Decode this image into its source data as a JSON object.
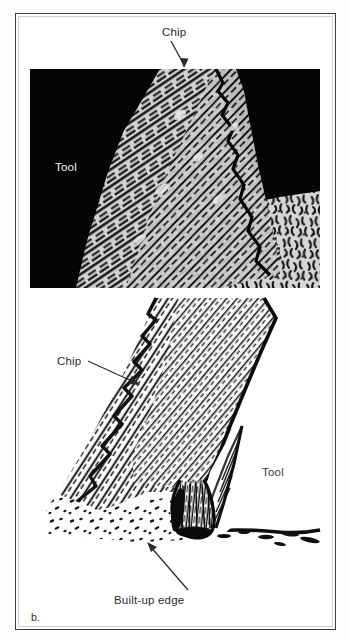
{
  "figure": {
    "panel_a": {
      "caption": "a.",
      "labels": {
        "chip": "Chip",
        "tool": "Tool"
      },
      "description": "Photomicrograph of chip formation showing dark tool body at left, lamellar chip flowing upward, and workpiece grain structure below"
    },
    "panel_b": {
      "caption": "b.",
      "labels": {
        "chip": "Chip",
        "tool": "Tool",
        "built_up_edge": "Built-up edge"
      },
      "description": "Micrograph drawing of chip formation with a built-up edge at the tool tip"
    },
    "colors": {
      "frame": "#3a3a3c",
      "frame_inner": "#cfcfcf",
      "page_background": "#ffffff",
      "label_text": "#2b2b2d",
      "label_text_on_dark": "#f4f4f4",
      "tool_dark": "#050505",
      "workpiece_light": "#d9d9d9",
      "ink": "#111111"
    }
  }
}
